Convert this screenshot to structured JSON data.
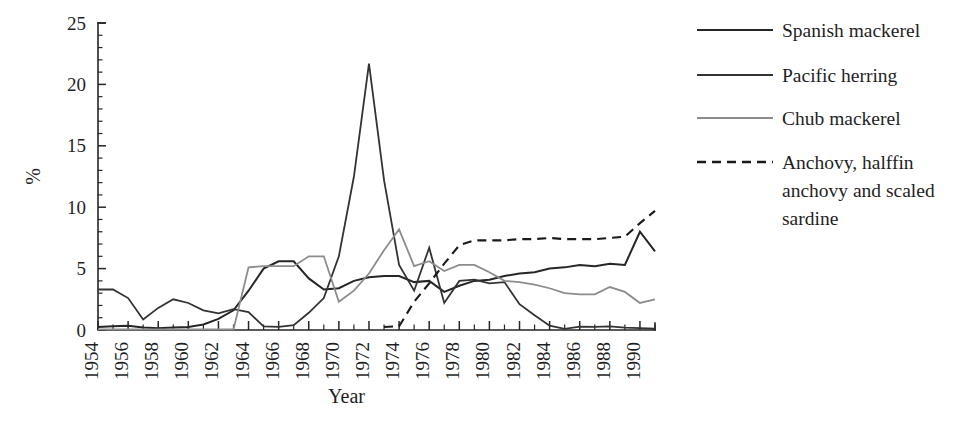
{
  "chart_data": {
    "type": "line",
    "title": "",
    "xlabel": "Year",
    "ylabel": "%",
    "xlim": [
      1954,
      1991
    ],
    "ylim": [
      0,
      25
    ],
    "grid": false,
    "legend_position": "right",
    "y_ticks": [
      0,
      5,
      10,
      15,
      20,
      25
    ],
    "y_tick_labels": [
      "0",
      "5",
      "10",
      "15",
      "20",
      "25"
    ],
    "y_minor_tick_step": 1,
    "x_ticks": [
      1954,
      1956,
      1958,
      1960,
      1962,
      1964,
      1966,
      1968,
      1970,
      1972,
      1974,
      1976,
      1978,
      1980,
      1982,
      1984,
      1986,
      1988,
      1990
    ],
    "x_tick_labels": [
      "1954",
      "1956",
      "1958",
      "1960",
      "1962",
      "1964",
      "1966",
      "1968",
      "1970",
      "1972",
      "1974",
      "1976",
      "1978",
      "1980",
      "1982",
      "1984",
      "1986",
      "1988",
      "1990"
    ],
    "x_tick_rotation": 90,
    "x_minor_tick_step": 1,
    "x": [
      1954,
      1955,
      1956,
      1957,
      1958,
      1959,
      1960,
      1961,
      1962,
      1963,
      1964,
      1965,
      1966,
      1967,
      1968,
      1969,
      1970,
      1971,
      1972,
      1973,
      1974,
      1975,
      1976,
      1977,
      1978,
      1979,
      1980,
      1981,
      1982,
      1983,
      1984,
      1985,
      1986,
      1987,
      1988,
      1989,
      1990,
      1991
    ],
    "series": [
      {
        "name": "Spanish mackerel",
        "color": "#262626",
        "width": 2.0,
        "dash": "none",
        "values": [
          0.25,
          0.3,
          0.35,
          0.2,
          0.15,
          0.2,
          0.25,
          0.45,
          0.9,
          1.6,
          3.2,
          5.0,
          5.6,
          5.6,
          4.2,
          3.3,
          3.4,
          4.0,
          4.3,
          4.4,
          4.4,
          3.9,
          4.0,
          3.1,
          3.6,
          4.0,
          4.1,
          4.4,
          4.6,
          4.7,
          5.0,
          5.1,
          5.3,
          5.2,
          5.4,
          5.3,
          8.0,
          6.4
        ]
      },
      {
        "name": "Pacific herring",
        "color": "#333333",
        "width": 1.8,
        "dash": "none",
        "values": [
          3.3,
          3.3,
          2.6,
          0.85,
          1.8,
          2.5,
          2.2,
          1.6,
          1.35,
          1.7,
          1.45,
          0.3,
          0.25,
          0.4,
          1.4,
          2.6,
          6.0,
          12.5,
          21.7,
          12.2,
          5.3,
          3.2,
          6.7,
          2.2,
          4.0,
          4.1,
          3.8,
          3.9,
          2.1,
          1.2,
          0.35,
          0.1,
          0.28,
          0.25,
          0.3,
          0.2,
          0.15,
          0.1
        ]
      },
      {
        "name": "Chub mackerel",
        "color": "#8c8c8c",
        "width": 1.8,
        "dash": "none",
        "values": [
          0.05,
          0.05,
          0.05,
          0.05,
          0.05,
          0.05,
          0.05,
          0.05,
          0.05,
          0.05,
          5.1,
          5.2,
          5.2,
          5.2,
          6.0,
          6.0,
          2.3,
          3.2,
          4.6,
          6.5,
          8.2,
          5.2,
          5.6,
          4.8,
          5.3,
          5.3,
          4.7,
          4.0,
          3.9,
          3.7,
          3.4,
          3.0,
          2.9,
          2.9,
          3.5,
          3.1,
          2.2,
          2.5
        ]
      },
      {
        "name": "Anchovy, halffin anchovy and scaled sardine",
        "color": "#1a1a1a",
        "width": 2.1,
        "dash": "9,6",
        "values": [
          null,
          null,
          null,
          null,
          null,
          null,
          null,
          null,
          null,
          null,
          null,
          null,
          null,
          null,
          null,
          null,
          null,
          null,
          null,
          0.25,
          0.3,
          2.3,
          3.8,
          5.4,
          6.9,
          7.3,
          7.3,
          7.3,
          7.4,
          7.4,
          7.5,
          7.4,
          7.4,
          7.4,
          7.5,
          7.6,
          8.7,
          9.7
        ]
      }
    ]
  },
  "legend": {
    "entries": [
      {
        "label": "Spanish mackerel",
        "color": "#262626",
        "dash": "none"
      },
      {
        "label": "Pacific herring",
        "color": "#333333",
        "dash": "none"
      },
      {
        "label": "Chub mackerel",
        "color": "#8c8c8c",
        "dash": "none"
      },
      {
        "label": "Anchovy, halffin",
        "color": "#1a1a1a",
        "dash": "9,6"
      },
      {
        "label": "anchovy and scaled",
        "color": "",
        "dash": ""
      },
      {
        "label": "sardine",
        "color": "",
        "dash": ""
      }
    ],
    "line_label_1": "Spanish mackerel",
    "line_label_2": "Pacific herring",
    "line_label_3": "Chub mackerel",
    "line_label_4a": "Anchovy, halffin",
    "line_label_4b": "anchovy and scaled",
    "line_label_4c": "sardine"
  }
}
